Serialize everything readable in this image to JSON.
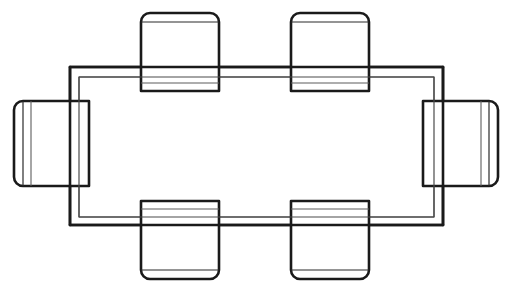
{
  "document": {
    "title": "Rectangular Table With Six Chairs — Plan View",
    "type": "cad-line-drawing",
    "view": "top-plan",
    "canvas": {
      "width": 511,
      "height": 290
    },
    "colors": {
      "background": "#ffffff",
      "outline": "#1a1a1a",
      "inner_line": "#5d5d5d",
      "fill": "#ffffff"
    }
  },
  "furniture": {
    "table": {
      "label": "rectangular-table",
      "top_outline": {
        "x": 70,
        "y": 67,
        "width": 373,
        "height": 158
      },
      "apron_outline": {
        "x": 79,
        "y": 77,
        "width": 355,
        "height": 140
      },
      "seat_count": 6
    },
    "chairs": [
      {
        "id": "chair-top-left",
        "label": "chair-top-left",
        "orientation": "north",
        "x": 141,
        "y": 13,
        "width": 78,
        "height": 78,
        "corner_radius": 9,
        "backrest_offset": 9
      },
      {
        "id": "chair-top-right",
        "label": "chair-top-right",
        "orientation": "north",
        "x": 291,
        "y": 13,
        "width": 78,
        "height": 78,
        "corner_radius": 9,
        "backrest_offset": 9
      },
      {
        "id": "chair-bottom-left",
        "label": "chair-bottom-left",
        "orientation": "south",
        "x": 141,
        "y": 201,
        "width": 78,
        "height": 78,
        "corner_radius": 9,
        "backrest_offset": 9
      },
      {
        "id": "chair-bottom-right",
        "label": "chair-bottom-right",
        "orientation": "south",
        "x": 291,
        "y": 201,
        "width": 78,
        "height": 78,
        "corner_radius": 9,
        "backrest_offset": 9
      },
      {
        "id": "chair-left",
        "label": "chair-left-end",
        "orientation": "west",
        "x": 14,
        "y": 101,
        "width": 75,
        "height": 85,
        "corner_radius": 9,
        "backrest_offset": 9
      },
      {
        "id": "chair-right",
        "label": "chair-right-end",
        "orientation": "east",
        "x": 423,
        "y": 101,
        "width": 75,
        "height": 85,
        "corner_radius": 9,
        "backrest_offset": 9
      }
    ]
  }
}
